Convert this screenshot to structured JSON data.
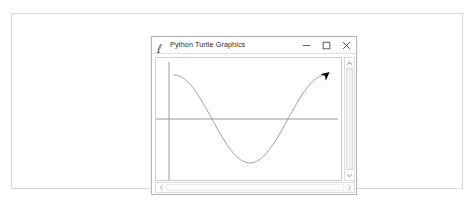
{
  "page": {
    "background_color": "#ffffff",
    "frame_border_color": "#d8d8d8"
  },
  "window": {
    "title": "Python Turtle Graphics",
    "icon": "python-feather-icon",
    "controls": {
      "minimize_label": "–",
      "maximize_label": "☐",
      "close_label": "✕"
    },
    "border_color": "#b4b4b4",
    "background_color": "#ffffff"
  },
  "canvas": {
    "background_color": "#ffffff",
    "border_color": "#cfcfcf",
    "axis_color": "#9a9a9a",
    "curve_color": "#8c8c8c",
    "turtle_color": "#000000",
    "turtle_shape": "arrow-cursor"
  },
  "scrollbars": {
    "vertical": {
      "up_arrow": "chevron-up-icon",
      "down_arrow": "chevron-down-icon",
      "thumb_color": "#f0f0f0"
    },
    "horizontal": {
      "left_arrow": "chevron-left-icon",
      "right_arrow": "chevron-right-icon",
      "thumb_color": "#fcfcfc"
    }
  },
  "chart_data": {
    "type": "line",
    "title": "Python Turtle Graphics",
    "xlabel": "",
    "ylabel": "",
    "function": "cosine",
    "grid": false,
    "legend": null,
    "axes": {
      "x_axis_y_pixel": 104,
      "y_axis_x_pixel": 152,
      "x_axis_visible": true,
      "y_axis_visible": true
    },
    "xlim": [
      0,
      360
    ],
    "ylim": [
      -1,
      1
    ],
    "x": [
      0,
      15,
      30,
      45,
      60,
      75,
      90,
      105,
      120,
      135,
      150,
      165,
      180,
      195,
      210,
      225,
      240,
      255,
      270,
      285,
      300,
      315,
      330,
      345,
      360
    ],
    "y": [
      1.0,
      0.966,
      0.866,
      0.707,
      0.5,
      0.259,
      0.0,
      -0.259,
      -0.5,
      -0.707,
      -0.866,
      -0.966,
      -1.0,
      -0.966,
      -0.866,
      -0.707,
      -0.5,
      -0.259,
      0.0,
      0.259,
      0.5,
      0.707,
      0.866,
      0.966,
      1.0
    ],
    "series": [
      {
        "name": "cos(x)",
        "color": "#8c8c8c",
        "values": [
          1.0,
          0.966,
          0.866,
          0.707,
          0.5,
          0.259,
          0.0,
          -0.259,
          -0.5,
          -0.707,
          -0.866,
          -0.966,
          -1.0,
          -0.966,
          -0.866,
          -0.707,
          -0.5,
          -0.259,
          0.0,
          0.259,
          0.5,
          0.707,
          0.866,
          0.966,
          1.0
        ]
      }
    ],
    "annotations": [
      {
        "name": "turtle-arrow",
        "x": 360,
        "y": 1.0,
        "heading_degrees": 40
      }
    ]
  }
}
